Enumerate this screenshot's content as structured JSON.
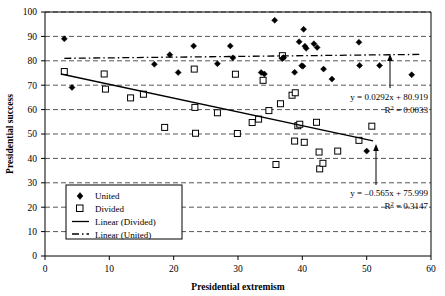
{
  "chart_data": {
    "type": "scatter",
    "title": "",
    "xlabel": "Presidential extremism",
    "ylabel": "Presidential success",
    "xlim": [
      0,
      60
    ],
    "ylim": [
      0,
      100
    ],
    "xticks": [
      0,
      10,
      20,
      30,
      40,
      50,
      60
    ],
    "yticks": [
      0,
      10,
      20,
      30,
      40,
      50,
      60,
      70,
      80,
      90,
      100
    ],
    "grid": "horizontal-dashed",
    "legend_position": "lower-left-inside",
    "legend": [
      {
        "label": "United",
        "marker": "filled-diamond"
      },
      {
        "label": "Divided",
        "marker": "open-square"
      },
      {
        "label": "Linear (Divided)",
        "marker": "solid-line"
      },
      {
        "label": "Linear (United)",
        "marker": "dash-dot-line"
      }
    ],
    "series": [
      {
        "name": "United",
        "marker": "filled-diamond",
        "points": [
          [
            3.0,
            89.0
          ],
          [
            4.2,
            69.1
          ],
          [
            17.0,
            78.6
          ],
          [
            19.4,
            82.5
          ],
          [
            20.7,
            75.2
          ],
          [
            23.1,
            86.1
          ],
          [
            26.8,
            78.8
          ],
          [
            28.8,
            86.1
          ],
          [
            29.2,
            81.2
          ],
          [
            33.6,
            75.2
          ],
          [
            34.1,
            74.6
          ],
          [
            35.7,
            96.6
          ],
          [
            36.9,
            80.9
          ],
          [
            37.1,
            81.3
          ],
          [
            38.8,
            75.3
          ],
          [
            39.5,
            87.8
          ],
          [
            39.9,
            78.0
          ],
          [
            40.1,
            77.8
          ],
          [
            40.2,
            92.9
          ],
          [
            40.4,
            86.0
          ],
          [
            40.6,
            85.1
          ],
          [
            41.8,
            87.0
          ],
          [
            42.3,
            85.5
          ],
          [
            43.3,
            76.6
          ],
          [
            44.6,
            72.5
          ],
          [
            48.8,
            87.6
          ],
          [
            48.9,
            78.1
          ],
          [
            50.0,
            43.0
          ],
          [
            52.0,
            78.1
          ],
          [
            57.0,
            74.3
          ]
        ]
      },
      {
        "name": "Divided",
        "marker": "open-square",
        "points": [
          [
            3.0,
            75.6
          ],
          [
            9.2,
            74.6
          ],
          [
            9.4,
            68.4
          ],
          [
            13.3,
            64.8
          ],
          [
            15.3,
            66.3
          ],
          [
            18.6,
            52.7
          ],
          [
            23.2,
            76.6
          ],
          [
            23.3,
            60.9
          ],
          [
            23.4,
            50.3
          ],
          [
            26.8,
            58.7
          ],
          [
            29.6,
            74.5
          ],
          [
            29.9,
            50.2
          ],
          [
            32.2,
            54.7
          ],
          [
            33.2,
            56.1
          ],
          [
            33.9,
            72.0
          ],
          [
            34.8,
            59.6
          ],
          [
            35.9,
            37.5
          ],
          [
            36.6,
            62.4
          ],
          [
            36.9,
            82.1
          ],
          [
            38.4,
            65.9
          ],
          [
            38.8,
            47.1
          ],
          [
            38.9,
            66.9
          ],
          [
            39.3,
            53.4
          ],
          [
            39.6,
            54.0
          ],
          [
            40.3,
            46.6
          ],
          [
            42.2,
            54.8
          ],
          [
            42.6,
            42.6
          ],
          [
            42.7,
            35.7
          ],
          [
            43.2,
            38.0
          ],
          [
            45.5,
            43.0
          ],
          [
            48.8,
            47.4
          ],
          [
            50.8,
            53.2
          ]
        ]
      }
    ],
    "trendlines": [
      {
        "name": "Linear (United)",
        "style": "dash-dot",
        "equation": "y = 0.0292x + 80.919",
        "r2_label": "R",
        "r2_exp": "2",
        "r2_value": "= 0.0033",
        "slope": 0.0292,
        "intercept": 80.919,
        "x_start": 3.0,
        "x_end": 58.5
      },
      {
        "name": "Linear (Divided)",
        "style": "solid",
        "equation": "y = –0.565x + 75.999",
        "r2_label": "R",
        "r2_exp": "2",
        "r2_value": "= 0.3147",
        "slope": -0.565,
        "intercept": 75.999,
        "x_start": 2.5,
        "x_end": 51.0
      }
    ],
    "annotations": [
      {
        "name": "united-equation",
        "line1": "y = 0.0292x + 80.919",
        "r2_prefix": "R",
        "r2_sup": "2",
        "r2_rest": " = 0.0033",
        "x": 288,
        "y": 97,
        "arrow": {
          "from_x": 390,
          "from_y": 88,
          "to_x": 390,
          "to_y": 56
        }
      },
      {
        "name": "divided-equation",
        "line1": "y = –0.565x + 75.999",
        "r2_prefix": "R",
        "r2_sup": "2",
        "r2_rest": " = 0.3147",
        "x": 288,
        "y": 193,
        "arrow": {
          "from_x": 376,
          "from_y": 185,
          "to_x": 376,
          "to_y": 146
        }
      }
    ]
  }
}
